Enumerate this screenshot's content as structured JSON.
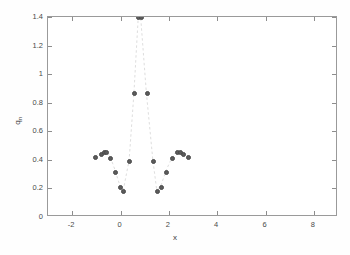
{
  "chart_data": {
    "type": "scatter",
    "title": "",
    "subtitle": "",
    "xlabel": "x",
    "ylabel": "q_n",
    "ylabel_base": "q",
    "ylabel_sub": "n",
    "xlim": [
      -3,
      9
    ],
    "ylim": [
      0,
      1.4
    ],
    "xticks": [
      -2,
      0,
      2,
      4,
      6,
      8
    ],
    "xticklabels": [
      "-2",
      "0",
      "2",
      "4",
      "6",
      "8"
    ],
    "yticks": [
      0,
      0.2,
      0.4,
      0.6,
      0.8,
      1,
      1.2,
      1.4
    ],
    "yticklabels": [
      "0",
      "0.2",
      "0.4",
      "0.6",
      "0.8",
      "1",
      "1.2",
      "1.4"
    ],
    "grid": false,
    "legend": null,
    "marker": "filled-circle",
    "marker_color": "#5b5b5b",
    "line_style": "dashed",
    "line_color": "#d9d9d9",
    "box_color": "#9a9a9a",
    "background": "#ffffff",
    "note": "Values at y=1.4 are clipped at the top of the axis.",
    "series": [
      {
        "name": "q_n",
        "points": [
          {
            "x": -1.03,
            "y": 0.415
          },
          {
            "x": -0.8,
            "y": 0.44
          },
          {
            "x": -0.68,
            "y": 0.45
          },
          {
            "x": -0.57,
            "y": 0.452
          },
          {
            "x": -0.4,
            "y": 0.408
          },
          {
            "x": -0.2,
            "y": 0.315
          },
          {
            "x": 0.0,
            "y": 0.205
          },
          {
            "x": 0.14,
            "y": 0.178
          },
          {
            "x": 0.38,
            "y": 0.387
          },
          {
            "x": 0.58,
            "y": 0.862
          },
          {
            "x": 0.76,
            "y": 1.4
          },
          {
            "x": 0.86,
            "y": 1.4
          },
          {
            "x": 1.1,
            "y": 0.862
          },
          {
            "x": 1.37,
            "y": 0.387
          },
          {
            "x": 1.53,
            "y": 0.178
          },
          {
            "x": 1.7,
            "y": 0.205
          },
          {
            "x": 1.92,
            "y": 0.315
          },
          {
            "x": 2.17,
            "y": 0.408
          },
          {
            "x": 2.36,
            "y": 0.452
          },
          {
            "x": 2.47,
            "y": 0.45
          },
          {
            "x": 2.59,
            "y": 0.44
          },
          {
            "x": 2.82,
            "y": 0.415
          }
        ]
      }
    ]
  }
}
